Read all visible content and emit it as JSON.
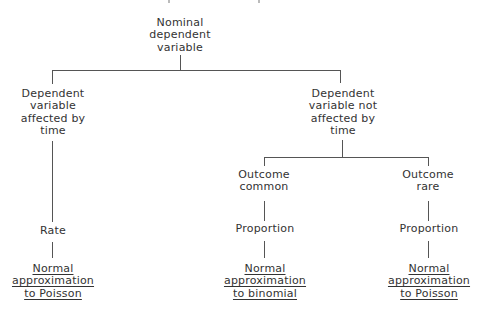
{
  "diagram": {
    "type": "decision-tree",
    "root": {
      "lines": [
        "Nominal",
        "dependent",
        "variable"
      ]
    },
    "branches": [
      {
        "lines": [
          "Dependent",
          "variable",
          "affected by",
          "time"
        ],
        "measure": {
          "lines": [
            "Rate"
          ]
        },
        "test": {
          "lines": [
            "Normal",
            "approximation",
            "to Poisson"
          ]
        }
      },
      {
        "lines": [
          "Dependent",
          "variable not",
          "affected by",
          "time"
        ],
        "children": [
          {
            "lines": [
              "Outcome",
              "common"
            ],
            "measure": {
              "lines": [
                "Proportion"
              ]
            },
            "test": {
              "lines": [
                "Normal",
                "approximation",
                "to binomial"
              ]
            }
          },
          {
            "lines": [
              "Outcome",
              "rare"
            ],
            "measure": {
              "lines": [
                "Proportion"
              ]
            },
            "test": {
              "lines": [
                "Normal",
                "approximation",
                "to Poisson"
              ]
            }
          }
        ]
      }
    ]
  }
}
